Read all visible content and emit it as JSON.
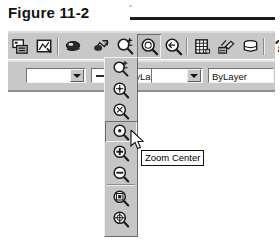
{
  "figure": {
    "caption": "Figure 11-2"
  },
  "toolbar": {
    "name": "standard-toolbar",
    "buttons": [
      {
        "id": "b1",
        "icon": "print-preview-icon",
        "label": "Print Preview",
        "pressed": false
      },
      {
        "id": "b2",
        "icon": "plot-icon",
        "label": "Plot",
        "pressed": false
      },
      {
        "id": "sep1",
        "icon": "separator",
        "label": "",
        "pressed": false
      },
      {
        "id": "b3",
        "icon": "pan-realtime-icon",
        "label": "Pan Realtime",
        "pressed": false
      },
      {
        "id": "b4",
        "icon": "zoom-realtime-icon",
        "label": "Zoom Realtime",
        "pressed": false
      },
      {
        "id": "b5",
        "icon": "zoom-window-icon",
        "label": "Zoom Window",
        "pressed": false
      },
      {
        "id": "b6",
        "icon": "zoom-flyout-icon",
        "label": "Zoom",
        "pressed": true
      },
      {
        "id": "b7",
        "icon": "zoom-previous-icon",
        "label": "Zoom Previous",
        "pressed": false
      },
      {
        "id": "sep2",
        "icon": "separator",
        "label": "",
        "pressed": false
      },
      {
        "id": "b8",
        "icon": "properties-icon",
        "label": "Properties",
        "pressed": false
      },
      {
        "id": "b9",
        "icon": "match-properties-icon",
        "label": "Match Properties",
        "pressed": false
      },
      {
        "id": "b10",
        "icon": "database-icon",
        "label": "dbConnect",
        "pressed": false
      },
      {
        "id": "sep3",
        "icon": "separator",
        "label": "",
        "pressed": false
      },
      {
        "id": "b11",
        "icon": "help-question-icon",
        "label": "Help",
        "pressed": false
      }
    ]
  },
  "properties_bar": {
    "name": "object-properties-toolbar",
    "color_combo": {
      "value": "",
      "dropdown_icon": "chevron-down-icon"
    },
    "linetype_combo": {
      "value": "ByLayer",
      "sample": "solid-line-sample",
      "dropdown_icon": "chevron-down-icon"
    },
    "lineweight_combo": {
      "value": "",
      "dropdown_icon": "chevron-down-icon"
    },
    "plotstyle_field": {
      "value": "ByLayer"
    }
  },
  "flyout": {
    "name": "zoom-flyout",
    "items": [
      {
        "id": "f1",
        "icon": "zoom-window-icon",
        "label": "Zoom Window",
        "selected": false,
        "separator_after": false
      },
      {
        "id": "f2",
        "icon": "zoom-dynamic-icon",
        "label": "Zoom Dynamic",
        "selected": false,
        "separator_after": false
      },
      {
        "id": "f3",
        "icon": "zoom-scale-icon",
        "label": "Zoom Scale",
        "selected": false,
        "separator_after": false
      },
      {
        "id": "f4",
        "icon": "zoom-center-icon",
        "label": "Zoom Center",
        "selected": true,
        "separator_after": false
      },
      {
        "id": "f5",
        "icon": "zoom-in-icon",
        "label": "Zoom In",
        "selected": false,
        "separator_after": false
      },
      {
        "id": "f6",
        "icon": "zoom-out-icon",
        "label": "Zoom Out",
        "selected": false,
        "separator_after": true
      },
      {
        "id": "f7",
        "icon": "zoom-all-icon",
        "label": "Zoom All",
        "selected": false,
        "separator_after": false
      },
      {
        "id": "f8",
        "icon": "zoom-extents-icon",
        "label": "Zoom Extents",
        "selected": false,
        "separator_after": false
      }
    ]
  },
  "tooltip": {
    "name": "zoom-center-tooltip",
    "text": "Zoom Center"
  },
  "cursor": {
    "name": "mouse-pointer",
    "type": "arrow"
  },
  "colors": {
    "toolbar_face": "#c8c8c8",
    "flyout_face": "#c6c6c6",
    "text": "#101010",
    "rule": "#1a1a1a",
    "field_bg": "#ffffff"
  }
}
